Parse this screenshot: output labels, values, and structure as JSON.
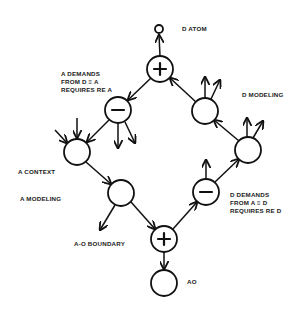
{
  "diagram": {
    "type": "signed flow diagram",
    "labels": {
      "d_atom": "D ATOM",
      "a_demands": [
        "A DEMANDS",
        "FROM D ≡ A",
        "REQUIRES RE A"
      ],
      "d_modeling": "D MODELING",
      "a_context": "A CONTEXT",
      "a_modeling": "A MODELING",
      "d_demands": [
        "D DEMANDS",
        "FROM A ≡ D",
        "REQUIRES RE D"
      ],
      "a_o_boundary": "A-O BOUNDARY",
      "ao": "AO"
    },
    "nodes": [
      {
        "id": "d-atom",
        "x": 159,
        "y": 29,
        "r": 4,
        "sign": ""
      },
      {
        "id": "top-plus",
        "x": 160,
        "y": 69,
        "r": 13,
        "sign": "+"
      },
      {
        "id": "left-minus",
        "x": 118,
        "y": 110,
        "r": 13,
        "sign": "-"
      },
      {
        "id": "a-context",
        "x": 77,
        "y": 152,
        "r": 13,
        "sign": ""
      },
      {
        "id": "a-modeling",
        "x": 121,
        "y": 193,
        "r": 13,
        "sign": ""
      },
      {
        "id": "bottom-plus",
        "x": 164,
        "y": 239,
        "r": 13,
        "sign": "+"
      },
      {
        "id": "ao",
        "x": 164,
        "y": 283,
        "r": 13,
        "sign": ""
      },
      {
        "id": "right-minus",
        "x": 206,
        "y": 192,
        "r": 13,
        "sign": "-"
      },
      {
        "id": "right-lower",
        "x": 248,
        "y": 150,
        "r": 13,
        "sign": ""
      },
      {
        "id": "d-modeling",
        "x": 205,
        "y": 111,
        "r": 13,
        "sign": ""
      }
    ],
    "edges": [
      {
        "from": "top-plus",
        "to": "d-atom"
      },
      {
        "from": "top-plus",
        "to": "left-minus"
      },
      {
        "from": "left-minus",
        "to": "a-context"
      },
      {
        "from": "a-context",
        "to": "a-modeling"
      },
      {
        "from": "a-modeling",
        "to": "bottom-plus"
      },
      {
        "from": "bottom-plus",
        "to": "ao"
      },
      {
        "from": "bottom-plus",
        "to": "right-minus"
      },
      {
        "from": "right-minus",
        "to": "right-lower"
      },
      {
        "from": "right-lower",
        "to": "d-modeling"
      },
      {
        "from": "d-modeling",
        "to": "top-plus"
      }
    ]
  }
}
